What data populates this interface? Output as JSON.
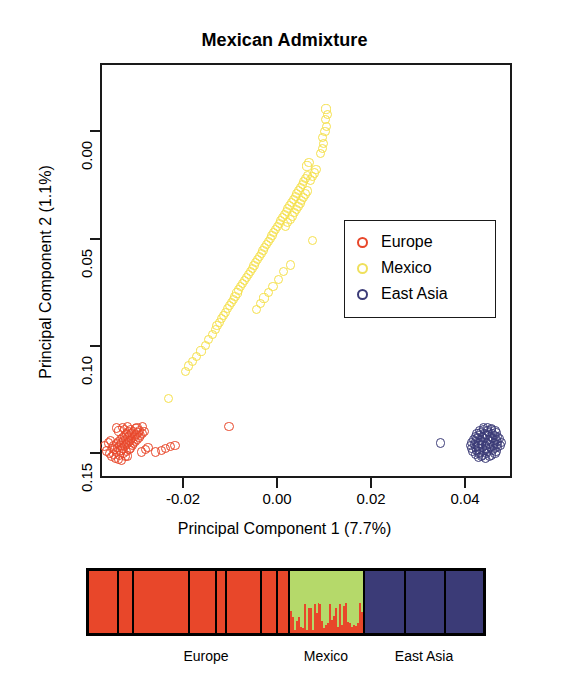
{
  "figure": {
    "title": "Mexican Admixture"
  },
  "pca": {
    "xtitle": "Principal Component 1 (7.7%)",
    "ytitle": "Principal Component 2 (1.1%)",
    "xticks": [
      "-0.02",
      "0.00",
      "0.02",
      "0.04"
    ],
    "yticks": [
      "0.00",
      "0.05",
      "0.10",
      "0.15"
    ]
  },
  "legend": {
    "items": [
      {
        "label": "Europe",
        "color": "#e8472a"
      },
      {
        "label": "Mexico",
        "color": "#f5e04a"
      },
      {
        "label": "East Asia",
        "color": "#3b3b77"
      }
    ]
  },
  "admixture": {
    "groups": [
      {
        "label": "Europe",
        "color": "#e8472a"
      },
      {
        "label": "Mexico",
        "color": "#b5d96a"
      },
      {
        "label": "East Asia",
        "color": "#3b3b77"
      }
    ]
  },
  "chart_data": {
    "type": "scatter",
    "title": "Mexican Admixture",
    "xlabel": "Principal Component 1 (7.7%)",
    "ylabel": "Principal Component 2 (1.1%)",
    "xlim": [
      -0.034,
      0.053
    ],
    "ylim": [
      0.165,
      -0.028
    ],
    "y_axis_inverted": true,
    "grid": false,
    "legend_position": "center-right",
    "xticks": [
      -0.02,
      0.0,
      0.02,
      0.04
    ],
    "yticks": [
      0.0,
      0.05,
      0.1,
      0.15
    ],
    "series": [
      {
        "name": "Europe",
        "color": "#e8472a",
        "points": [
          [
            -0.0305,
            -0.0185
          ],
          [
            -0.0312,
            -0.0178
          ],
          [
            -0.0298,
            -0.019
          ],
          [
            -0.029,
            -0.0172
          ],
          [
            -0.0303,
            -0.0165
          ],
          [
            -0.0316,
            -0.016
          ],
          [
            -0.0295,
            -0.0156
          ],
          [
            -0.0286,
            -0.0168
          ],
          [
            -0.0309,
            -0.015
          ],
          [
            -0.032,
            -0.0171
          ],
          [
            -0.03,
            -0.0144
          ],
          [
            -0.0288,
            -0.0148
          ],
          [
            -0.0313,
            -0.0139
          ],
          [
            -0.0325,
            -0.0155
          ],
          [
            -0.0297,
            -0.0133
          ],
          [
            -0.0283,
            -0.014
          ],
          [
            -0.0307,
            -0.0128
          ],
          [
            -0.0318,
            -0.0133
          ],
          [
            -0.0292,
            -0.0124
          ],
          [
            -0.0279,
            -0.0131
          ],
          [
            -0.0302,
            -0.0118
          ],
          [
            -0.0315,
            -0.0121
          ],
          [
            -0.0288,
            -0.0114
          ],
          [
            -0.0276,
            -0.012
          ],
          [
            -0.0299,
            -0.0108
          ],
          [
            -0.031,
            -0.0112
          ],
          [
            -0.0285,
            -0.0104
          ],
          [
            -0.0273,
            -0.011
          ],
          [
            -0.0294,
            -0.0099
          ],
          [
            -0.0306,
            -0.0102
          ],
          [
            -0.0281,
            -0.0095
          ],
          [
            -0.027,
            -0.01
          ],
          [
            -0.029,
            -0.009
          ],
          [
            -0.0301,
            -0.0093
          ],
          [
            -0.0277,
            -0.0086
          ],
          [
            -0.0266,
            -0.0091
          ],
          [
            -0.0286,
            -0.0081
          ],
          [
            -0.0296,
            -0.0084
          ],
          [
            -0.0272,
            -0.0077
          ],
          [
            -0.0262,
            -0.0082
          ],
          [
            -0.0282,
            -0.0072
          ],
          [
            -0.0292,
            -0.0075
          ],
          [
            -0.0268,
            -0.0068
          ],
          [
            -0.0258,
            -0.0073
          ],
          [
            -0.0278,
            -0.0063
          ],
          [
            -0.0288,
            -0.0066
          ],
          [
            -0.0264,
            -0.0059
          ],
          [
            -0.0254,
            -0.0064
          ],
          [
            -0.0274,
            -0.0054
          ],
          [
            -0.0284,
            -0.0057
          ],
          [
            -0.0261,
            -0.005
          ],
          [
            -0.0251,
            -0.0056
          ],
          [
            -0.0293,
            -0.0047
          ],
          [
            -0.0304,
            -0.0052
          ],
          [
            -0.0268,
            -0.0043
          ],
          [
            -0.028,
            -0.0046
          ],
          [
            -0.0256,
            -0.015
          ],
          [
            -0.0248,
            -0.014
          ],
          [
            -0.0243,
            -0.0128
          ],
          [
            -0.033,
            -0.0145
          ],
          [
            -0.0334,
            -0.0122
          ],
          [
            -0.0327,
            -0.0108
          ],
          [
            -0.0322,
            -0.0095
          ],
          [
            -0.031,
            -0.0038
          ],
          [
            -0.0296,
            -0.0034
          ],
          [
            -0.0286,
            -0.003
          ],
          [
            -0.0266,
            -0.0035
          ],
          [
            -0.0255,
            -0.003
          ],
          [
            -0.0227,
            -0.015
          ],
          [
            -0.0214,
            -0.0142
          ],
          [
            -0.0206,
            -0.0133
          ],
          [
            -0.0196,
            -0.0126
          ],
          [
            -0.0186,
            -0.012
          ],
          [
            -0.0072,
            -0.003
          ]
        ]
      },
      {
        "name": "Mexico",
        "color": "#f5e04a",
        "points": [
          [
            -0.02,
            0.01
          ],
          [
            -0.0163,
            0.0226
          ],
          [
            -0.0157,
            0.025
          ],
          [
            -0.0149,
            0.0272
          ],
          [
            -0.014,
            0.0295
          ],
          [
            -0.0131,
            0.032
          ],
          [
            -0.0122,
            0.0345
          ],
          [
            -0.0115,
            0.0372
          ],
          [
            -0.0107,
            0.0398
          ],
          [
            -0.01,
            0.042
          ],
          [
            -0.0097,
            0.0438
          ],
          [
            -0.0092,
            0.0452
          ],
          [
            -0.0088,
            0.047
          ],
          [
            -0.0084,
            0.0485
          ],
          [
            -0.008,
            0.05
          ],
          [
            -0.0075,
            0.0516
          ],
          [
            -0.0071,
            0.053
          ],
          [
            -0.0067,
            0.0545
          ],
          [
            -0.0063,
            0.056
          ],
          [
            -0.0059,
            0.0575
          ],
          [
            -0.0055,
            0.059
          ],
          [
            -0.0051,
            0.0604
          ],
          [
            -0.0047,
            0.0618
          ],
          [
            -0.0043,
            0.0632
          ],
          [
            -0.0039,
            0.0646
          ],
          [
            -0.0035,
            0.066
          ],
          [
            -0.0031,
            0.0674
          ],
          [
            -0.0027,
            0.0688
          ],
          [
            -0.0023,
            0.0702
          ],
          [
            -0.0019,
            0.0716
          ],
          [
            -0.0016,
            0.073
          ],
          [
            -0.0012,
            0.0744
          ],
          [
            -0.0008,
            0.0758
          ],
          [
            -0.0004,
            0.0772
          ],
          [
            0.0,
            0.0786
          ],
          [
            0.0004,
            0.08
          ],
          [
            0.0007,
            0.0814
          ],
          [
            0.0011,
            0.0828
          ],
          [
            0.0015,
            0.0842
          ],
          [
            0.0019,
            0.0856
          ],
          [
            0.0022,
            0.087
          ],
          [
            0.0026,
            0.0884
          ],
          [
            0.003,
            0.0898
          ],
          [
            0.0034,
            0.0912
          ],
          [
            0.0037,
            0.0926
          ],
          [
            0.0041,
            0.094
          ],
          [
            0.0045,
            0.0954
          ],
          [
            0.0049,
            0.0968
          ],
          [
            0.0052,
            0.0982
          ],
          [
            0.0056,
            0.0996
          ],
          [
            0.006,
            0.101
          ],
          [
            0.0064,
            0.1024
          ],
          [
            0.0068,
            0.1038
          ],
          [
            0.0071,
            0.1052
          ],
          [
            0.0075,
            0.1066
          ],
          [
            0.0079,
            0.108
          ],
          [
            0.0083,
            0.1094
          ],
          [
            0.0086,
            0.1108
          ],
          [
            0.009,
            0.1122
          ],
          [
            0.0094,
            0.1136
          ],
          [
            0.0047,
            0.09
          ],
          [
            0.0052,
            0.0916
          ],
          [
            0.0058,
            0.0932
          ],
          [
            0.0062,
            0.0948
          ],
          [
            0.0066,
            0.0963
          ],
          [
            0.007,
            0.0978
          ],
          [
            0.0074,
            0.0992
          ],
          [
            0.0078,
            0.1006
          ],
          [
            0.0082,
            0.102
          ],
          [
            0.0086,
            0.1035
          ],
          [
            0.009,
            0.105
          ],
          [
            0.0094,
            0.1064
          ],
          [
            0.01,
            0.1115
          ],
          [
            0.0104,
            0.1132
          ],
          [
            0.0108,
            0.1148
          ],
          [
            0.0112,
            0.1164
          ],
          [
            0.0093,
            0.118
          ],
          [
            0.0097,
            0.1196
          ],
          [
            0.0121,
            0.124
          ],
          [
            0.0125,
            0.1262
          ],
          [
            0.0128,
            0.1285
          ],
          [
            0.0126,
            0.1312
          ],
          [
            0.0131,
            0.134
          ],
          [
            0.0134,
            0.1365
          ],
          [
            0.0132,
            0.1395
          ],
          [
            0.0137,
            0.142
          ],
          [
            0.0133,
            0.1445
          ],
          [
            0.0104,
            0.0832
          ],
          [
            0.0058,
            0.072
          ],
          [
            0.0044,
            0.0688
          ],
          [
            0.0032,
            0.0652
          ],
          [
            0.0021,
            0.062
          ],
          [
            0.0012,
            0.0592
          ],
          [
            0.0002,
            0.0566
          ],
          [
            -0.0006,
            0.054
          ],
          [
            -0.0014,
            0.0512
          ]
        ]
      },
      {
        "name": "East Asia",
        "color": "#3b3b77",
        "points": [
          [
            0.0455,
            -0.0175
          ],
          [
            0.0462,
            -0.0168
          ],
          [
            0.047,
            -0.018
          ],
          [
            0.0478,
            -0.0172
          ],
          [
            0.0448,
            -0.0162
          ],
          [
            0.0456,
            -0.0155
          ],
          [
            0.0464,
            -0.0166
          ],
          [
            0.0472,
            -0.0158
          ],
          [
            0.0482,
            -0.0164
          ],
          [
            0.049,
            -0.0156
          ],
          [
            0.0442,
            -0.0148
          ],
          [
            0.045,
            -0.0142
          ],
          [
            0.0458,
            -0.015
          ],
          [
            0.0466,
            -0.0144
          ],
          [
            0.0474,
            -0.0148
          ],
          [
            0.0484,
            -0.0142
          ],
          [
            0.0492,
            -0.0148
          ],
          [
            0.044,
            -0.0134
          ],
          [
            0.0448,
            -0.0128
          ],
          [
            0.0456,
            -0.0136
          ],
          [
            0.0464,
            -0.013
          ],
          [
            0.0472,
            -0.0134
          ],
          [
            0.048,
            -0.0128
          ],
          [
            0.0488,
            -0.0134
          ],
          [
            0.0496,
            -0.0128
          ],
          [
            0.0438,
            -0.012
          ],
          [
            0.0446,
            -0.0114
          ],
          [
            0.0454,
            -0.0122
          ],
          [
            0.0462,
            -0.0116
          ],
          [
            0.047,
            -0.012
          ],
          [
            0.0478,
            -0.0114
          ],
          [
            0.0486,
            -0.012
          ],
          [
            0.0494,
            -0.0114
          ],
          [
            0.0502,
            -0.012
          ],
          [
            0.044,
            -0.0106
          ],
          [
            0.0448,
            -0.01
          ],
          [
            0.0456,
            -0.0108
          ],
          [
            0.0464,
            -0.0102
          ],
          [
            0.0472,
            -0.0106
          ],
          [
            0.048,
            -0.01
          ],
          [
            0.0488,
            -0.0106
          ],
          [
            0.0496,
            -0.01
          ],
          [
            0.0504,
            -0.0106
          ],
          [
            0.0444,
            -0.0092
          ],
          [
            0.0452,
            -0.0086
          ],
          [
            0.046,
            -0.0094
          ],
          [
            0.0468,
            -0.0088
          ],
          [
            0.0476,
            -0.0092
          ],
          [
            0.0484,
            -0.0086
          ],
          [
            0.0492,
            -0.0092
          ],
          [
            0.05,
            -0.0086
          ],
          [
            0.0448,
            -0.0078
          ],
          [
            0.0456,
            -0.0072
          ],
          [
            0.0464,
            -0.008
          ],
          [
            0.0472,
            -0.0074
          ],
          [
            0.048,
            -0.0078
          ],
          [
            0.0488,
            -0.0072
          ],
          [
            0.0496,
            -0.0078
          ],
          [
            0.0452,
            -0.0064
          ],
          [
            0.046,
            -0.0058
          ],
          [
            0.0468,
            -0.0066
          ],
          [
            0.0476,
            -0.006
          ],
          [
            0.0484,
            -0.0064
          ],
          [
            0.0492,
            -0.0058
          ],
          [
            0.0458,
            -0.005
          ],
          [
            0.0466,
            -0.0046
          ],
          [
            0.0474,
            -0.0052
          ],
          [
            0.0482,
            -0.0046
          ],
          [
            0.049,
            -0.005
          ],
          [
            0.0466,
            -0.0038
          ],
          [
            0.0474,
            -0.0034
          ],
          [
            0.0482,
            -0.004
          ],
          [
            0.0374,
            -0.0108
          ]
        ]
      }
    ],
    "admixture_bar": {
      "type": "bar",
      "description": "STRUCTURE-style stacked ancestry bar plot",
      "ancestry_components": [
        {
          "name": "European",
          "color": "#e8472a"
        },
        {
          "name": "Native American",
          "color": "#b5d96a"
        },
        {
          "name": "East Asian",
          "color": "#3b3b77"
        }
      ],
      "groups": [
        {
          "label": "Europe",
          "start_pct": 0,
          "end_pct": 50.5,
          "european": 1.0,
          "native_american": 0.0,
          "east_asian": 0.0,
          "subpanel_separators_pct": [
            7.0,
            11.0,
            25.0,
            32.0,
            34.5,
            43.5,
            47.5
          ]
        },
        {
          "label": "Mexico",
          "start_pct": 50.5,
          "end_pct": 69.5,
          "european_mean": 0.33,
          "native_american_mean": 0.67,
          "east_asian": 0.0
        },
        {
          "label": "East Asia",
          "start_pct": 69.5,
          "end_pct": 100,
          "european": 0.0,
          "native_american": 0.0,
          "east_asian": 1.0,
          "subpanel_separators_pct": [
            80.0,
            90.0
          ]
        }
      ]
    }
  }
}
